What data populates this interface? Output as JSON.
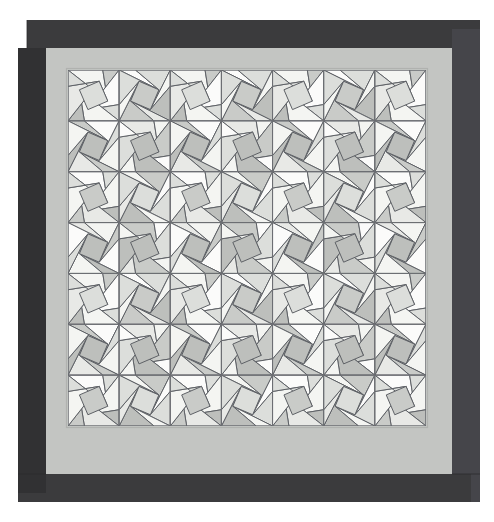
{
  "artwork": {
    "title": "Kaleidoscope Quilt",
    "type": "geometric-tiling",
    "canvas": {
      "width": 494,
      "height": 522
    },
    "background_color": "#ffffff"
  },
  "layers": {
    "outer_margin": {
      "name": "white-margin",
      "color": "#ffffff",
      "left": 0,
      "top": 0,
      "right": 494,
      "bottom": 522
    },
    "binding": {
      "name": "dark-binding-border",
      "color": "#3b3b3d",
      "color_shadow": "#313133",
      "color_highlight": "#45454a",
      "outer": {
        "x": 18,
        "y": 20,
        "width": 462,
        "height": 482
      },
      "thickness": 28,
      "corner_style": "mitered-offset",
      "offset": 9
    },
    "sashing": {
      "name": "light-gray-sashing",
      "color": "#c3c5c2",
      "color_inner_line": "#b0b2af",
      "outer": {
        "x": 46,
        "y": 48,
        "width": 406,
        "height": 426
      },
      "thickness": 22
    },
    "field": {
      "name": "pattern-field",
      "background": "#f2f3f1",
      "outer": {
        "x": 68,
        "y": 70,
        "width": 358,
        "height": 356
      }
    }
  },
  "grid": {
    "name": "block-grid",
    "columns": 7,
    "rows": 7,
    "cell_width": 51.14,
    "cell_height": 50.86,
    "origin_x": 68,
    "origin_y": 70,
    "line_color": "#6e7175",
    "line_width": 0.9
  },
  "block": {
    "name": "kaleidoscope-block",
    "description": "Square block subdivided into 8 triangular wedges with an inset rotated square, forming a pinwheel star.",
    "stroke_color": "#5e6166",
    "stroke_width": 1.0,
    "inset_ratio": 0.3,
    "spin_offset": 0.18
  },
  "palette": {
    "name": "fabric-palette",
    "swatches": [
      {
        "name": "cream",
        "hex": "#f4f5f2"
      },
      {
        "name": "white",
        "hex": "#fbfbfa"
      },
      {
        "name": "pale-gray",
        "hex": "#e8e9e6"
      },
      {
        "name": "light-gray",
        "hex": "#dcdedb"
      },
      {
        "name": "mid-gray",
        "hex": "#c9cbc8"
      },
      {
        "name": "gray",
        "hex": "#bdbfbc"
      },
      {
        "name": "deep-gray",
        "hex": "#d2d4d1"
      }
    ]
  },
  "shading_map": {
    "note": "Per-wedge swatch index (0-6) for each of 8 wedges, cycled across the 7x7 grid by (row+col) parity and position.",
    "variants": [
      [
        0,
        4,
        1,
        3,
        0,
        5,
        2,
        3
      ],
      [
        2,
        0,
        4,
        1,
        5,
        0,
        3,
        1
      ],
      [
        1,
        3,
        0,
        5,
        2,
        4,
        0,
        3
      ],
      [
        4,
        1,
        3,
        0,
        4,
        2,
        5,
        0
      ]
    ]
  }
}
